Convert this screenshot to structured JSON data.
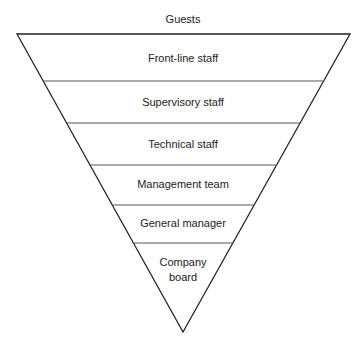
{
  "diagram": {
    "type": "inverted-pyramid",
    "top_label": "Guests",
    "layers": [
      {
        "label": "Front-line staff"
      },
      {
        "label": "Supervisory staff"
      },
      {
        "label": "Technical staff"
      },
      {
        "label": "Management team"
      },
      {
        "label": "General manager"
      },
      {
        "label_line1": "Company",
        "label_line2": "board"
      }
    ],
    "colors": {
      "outline": "#222222",
      "divider": "#555555",
      "text": "#222222",
      "background": "#ffffff"
    }
  }
}
